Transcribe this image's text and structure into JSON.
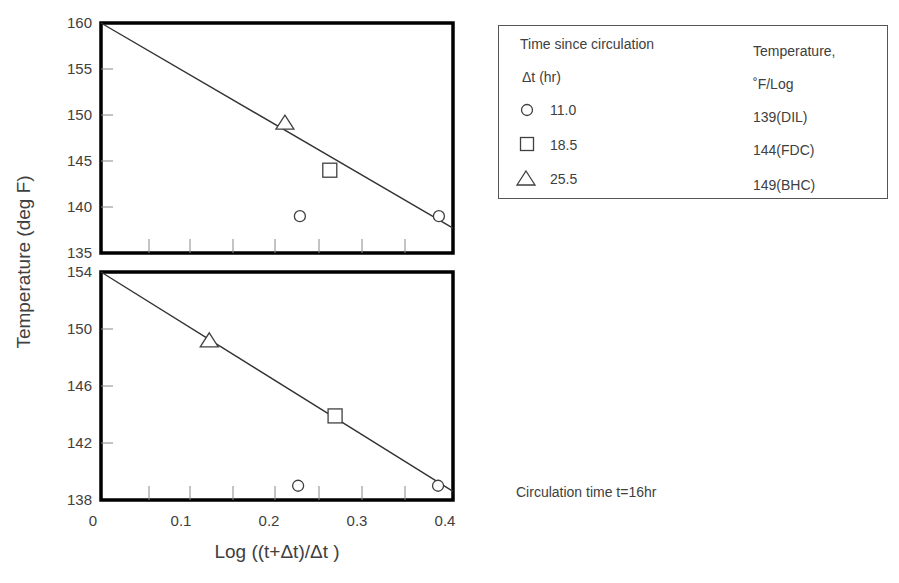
{
  "chart_data": [
    {
      "type": "scatter",
      "panel": "top",
      "title": "",
      "xlabel": "Log ((t+Δt)/Δt )",
      "ylabel": "Temperature (deg F)",
      "xlim": [
        0,
        0.4
      ],
      "ylim": [
        135,
        160
      ],
      "yticks": [
        135,
        140,
        145,
        150,
        155,
        160
      ],
      "ytick_labels": [
        "135",
        "140",
        "145",
        "150",
        "155",
        "160"
      ],
      "grid": false,
      "series": [
        {
          "name": "11.0 hr (139 DIL)",
          "marker": "circle",
          "points": [
            [
              0.226,
              139
            ],
            [
              0.384,
              139
            ]
          ]
        },
        {
          "name": "18.5 hr (144 FDC)",
          "marker": "square",
          "points": [
            [
              0.26,
              144
            ]
          ]
        },
        {
          "name": "25.5 hr (149 BHC)",
          "marker": "triangle",
          "points": [
            [
              0.209,
              149
            ]
          ]
        }
      ],
      "fit_line": {
        "x": [
          0,
          0.4
        ],
        "y": [
          160,
          137.7
        ]
      }
    },
    {
      "type": "scatter",
      "panel": "bottom",
      "title": "",
      "xlabel": "Log ((t+Δt)/Δt )",
      "ylabel": "Temperature (deg F)",
      "xlim": [
        0,
        0.4
      ],
      "ylim": [
        138,
        154
      ],
      "xticks": [
        0,
        0.1,
        0.2,
        0.3,
        0.4
      ],
      "xtick_labels": [
        "0",
        "0.1",
        "0.2",
        "0.3",
        "0.4"
      ],
      "yticks": [
        138,
        142,
        146,
        150,
        154
      ],
      "ytick_labels": [
        "138",
        "142",
        "146",
        "150",
        "154"
      ],
      "grid": false,
      "series": [
        {
          "name": "11.0 hr (139 DIL)",
          "marker": "circle",
          "points": [
            [
              0.224,
              139
            ],
            [
              0.383,
              139
            ]
          ]
        },
        {
          "name": "18.5 hr (144 FDC)",
          "marker": "square",
          "points": [
            [
              0.266,
              143.9
            ]
          ]
        },
        {
          "name": "25.5 hr (149 BHC)",
          "marker": "triangle",
          "points": [
            [
              0.123,
              149.1
            ]
          ]
        }
      ],
      "fit_line": {
        "x": [
          0,
          0.4
        ],
        "y": [
          154,
          138.6
        ]
      }
    }
  ],
  "axes": {
    "ylabel": "Temperature (deg F)",
    "xlabel": "Log ((t+Δt)/Δt )",
    "x_tick_labels": [
      "0",
      "0.1",
      "0.2",
      "0.3",
      "0.4"
    ],
    "top_y_tick_labels": [
      "160",
      "155",
      "150",
      "145",
      "140",
      "135"
    ],
    "bottom_y_tick_labels": [
      "154",
      "150",
      "146",
      "142",
      "138"
    ]
  },
  "legend": {
    "col1_header_line1": "Time since circulation",
    "col1_header_line2": "Δt (hr)",
    "col2_header_line1": "Temperature,",
    "col2_header_line2": "˚F/Log",
    "rows": [
      {
        "marker": "circle",
        "dt": "11.0",
        "temp": "139(DIL)"
      },
      {
        "marker": "square",
        "dt": "18.5",
        "temp": "144(FDC)"
      },
      {
        "marker": "triangle",
        "dt": "25.5",
        "temp": "149(BHC)"
      }
    ]
  },
  "note": "Circulation time t=16hr",
  "colors": {
    "text": "#404040",
    "frame": "#000000",
    "line": "#333333"
  }
}
